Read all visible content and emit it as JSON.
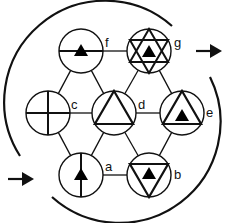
{
  "diagram": {
    "colors": {
      "stroke": "#111111",
      "fill": "#000000",
      "background": "#ffffff"
    },
    "nodes": [
      {
        "id": "f",
        "label": "f",
        "symbol": "horizontal-line-with-small-filled-triangle"
      },
      {
        "id": "g",
        "label": "g",
        "symbol": "hexagram-with-horizontal-lines-and-small-filled-triangle"
      },
      {
        "id": "c",
        "label": "c",
        "symbol": "cross"
      },
      {
        "id": "d",
        "label": "d",
        "symbol": "open-triangle"
      },
      {
        "id": "e",
        "label": "e",
        "symbol": "open-triangle-with-small-filled-triangle"
      },
      {
        "id": "a",
        "label": "a",
        "symbol": "vertical-line-with-small-filled-triangle"
      },
      {
        "id": "b",
        "label": "b",
        "symbol": "inverted-triangle-with-small-filled-triangle"
      }
    ],
    "edges": [
      [
        "f",
        "g"
      ],
      [
        "c",
        "d"
      ],
      [
        "d",
        "e"
      ],
      [
        "a",
        "b"
      ],
      [
        "f",
        "c"
      ],
      [
        "f",
        "d"
      ],
      [
        "g",
        "d"
      ],
      [
        "g",
        "e"
      ],
      [
        "c",
        "a"
      ],
      [
        "d",
        "a"
      ],
      [
        "d",
        "b"
      ],
      [
        "e",
        "b"
      ]
    ],
    "flow": {
      "entry": "input-arrow",
      "exit": "output-arrow",
      "direction": "clockwise"
    }
  }
}
